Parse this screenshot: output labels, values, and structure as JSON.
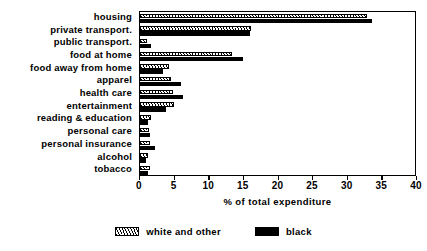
{
  "chart_data": {
    "type": "bar",
    "orientation": "horizontal",
    "title": "",
    "xlabel": "% of total expenditure",
    "ylabel": "",
    "xlim": [
      0,
      40
    ],
    "xticks": [
      0,
      5,
      10,
      15,
      20,
      25,
      30,
      35,
      40
    ],
    "grid": false,
    "legend_position": "bottom",
    "categories": [
      "housing",
      "private transport.",
      "public transport.",
      "food at home",
      "food away from home",
      "apparel",
      "health care",
      "entertainment",
      "reading & education",
      "personal care",
      "personal insurance",
      "alcohol",
      "tobacco"
    ],
    "series": [
      {
        "name": "white and other",
        "style": "hatched",
        "color": "#000000",
        "values": [
          32.8,
          16.1,
          1.0,
          13.3,
          4.2,
          4.5,
          4.8,
          4.9,
          1.6,
          1.3,
          1.4,
          1.1,
          1.4
        ]
      },
      {
        "name": "black",
        "style": "solid",
        "color": "#000000",
        "values": [
          33.5,
          15.9,
          1.6,
          14.9,
          3.3,
          5.9,
          6.2,
          3.8,
          1.1,
          1.4,
          2.2,
          0.8,
          1.2
        ]
      }
    ]
  },
  "legend": {
    "items": [
      {
        "label": "white and other",
        "swatch": "hatched-swatch"
      },
      {
        "label": "black",
        "swatch": "black-swatch"
      }
    ]
  },
  "axis": {
    "x_title": "% of total expenditure",
    "tick_labels": [
      "0",
      "5",
      "10",
      "15",
      "20",
      "25",
      "30",
      "35",
      "40"
    ]
  }
}
